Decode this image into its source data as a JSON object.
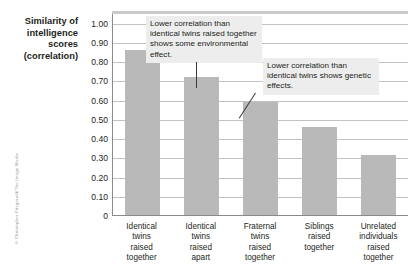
{
  "credit": "© Christopher Fitzgerald/The Image Works",
  "chart_data": {
    "type": "bar",
    "title": "",
    "ylabel": "Similarity of intelligence scores (correlation)",
    "ylabel_lines": [
      "Similarity of",
      "intelligence",
      "scores",
      "(correlation)"
    ],
    "xlabel": "",
    "categories": [
      "Identical twins raised together",
      "Identical twins raised apart",
      "Fraternal twins raised together",
      "Siblings raised together",
      "Unrelated individuals raised together"
    ],
    "category_lines": [
      [
        "Identical",
        "twins",
        "raised",
        "together"
      ],
      [
        "Identical",
        "twins",
        "raised",
        "apart"
      ],
      [
        "Fraternal",
        "twins",
        "raised",
        "together"
      ],
      [
        "Siblings",
        "raised",
        "together"
      ],
      [
        "Unrelated",
        "individuals",
        "raised",
        "together"
      ]
    ],
    "values": [
      0.86,
      0.72,
      0.59,
      0.46,
      0.31
    ],
    "ylim": [
      0,
      1.05
    ],
    "yticks": [
      0,
      0.1,
      0.2,
      0.3,
      0.4,
      0.5,
      0.6,
      0.7,
      0.8,
      0.9,
      1.0
    ],
    "ytick_labels": [
      "0",
      "0.10",
      "0.20",
      "0.30",
      "0.40",
      "0.50",
      "0.60",
      "0.70",
      "0.80",
      "0.90",
      "1.00"
    ],
    "grid": true,
    "legend": "none",
    "bar_color": "#b9b9b9",
    "annotations": [
      {
        "text": "Lower correlation than identical twins raised together shows some environmental effect.",
        "target_category": "Identical twins raised apart"
      },
      {
        "text": "Lower correlation than identical twins shows genetic effects.",
        "target_category": "Fraternal twins raised together"
      }
    ]
  }
}
